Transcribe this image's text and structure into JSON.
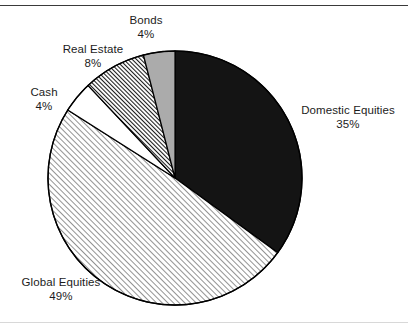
{
  "chart_data": {
    "type": "pie",
    "title": "",
    "subtitle": "",
    "xlabel": "",
    "ylabel": "",
    "legend_position": "none",
    "grid": false,
    "labels_placement": "outside",
    "start_angle_deg": 0,
    "direction": "clockwise",
    "categories": [
      "Domestic Equities",
      "Global Equities",
      "Cash",
      "Real Estate",
      "Bonds"
    ],
    "values": [
      35,
      49,
      4,
      8,
      4
    ],
    "unit": "%",
    "slices": [
      {
        "name": "Domestic Equities",
        "value": 35,
        "percent_text": "35%",
        "fill_style": "solid",
        "color": "#141414",
        "start_angle_deg": 0,
        "end_angle_deg": 126
      },
      {
        "name": "Global Equities",
        "value": 49,
        "percent_text": "49%",
        "fill_style": "hatch-light-diagonal",
        "color": "#9a9a9a",
        "start_angle_deg": 126,
        "end_angle_deg": 302.4
      },
      {
        "name": "Cash",
        "value": 4,
        "percent_text": "4%",
        "fill_style": "solid",
        "color": "#ffffff",
        "start_angle_deg": 302.4,
        "end_angle_deg": 316.8
      },
      {
        "name": "Real Estate",
        "value": 8,
        "percent_text": "8%",
        "fill_style": "hatch-dark-diagonal",
        "color": "#2b2b2b",
        "start_angle_deg": 316.8,
        "end_angle_deg": 345.6
      },
      {
        "name": "Bonds",
        "value": 4,
        "percent_text": "4%",
        "fill_style": "solid",
        "color": "#ababab",
        "start_angle_deg": 345.6,
        "end_angle_deg": 360
      }
    ],
    "outline_color": "#000000"
  },
  "labels": {
    "bonds": {
      "name": "Bonds",
      "pct": "4%"
    },
    "real_estate": {
      "name": "Real Estate",
      "pct": "8%"
    },
    "cash": {
      "name": "Cash",
      "pct": "4%"
    },
    "domestic_equities": {
      "name": "Domestic Equities",
      "pct": "35%"
    },
    "global_equities": {
      "name": "Global Equities",
      "pct": "49%"
    }
  }
}
